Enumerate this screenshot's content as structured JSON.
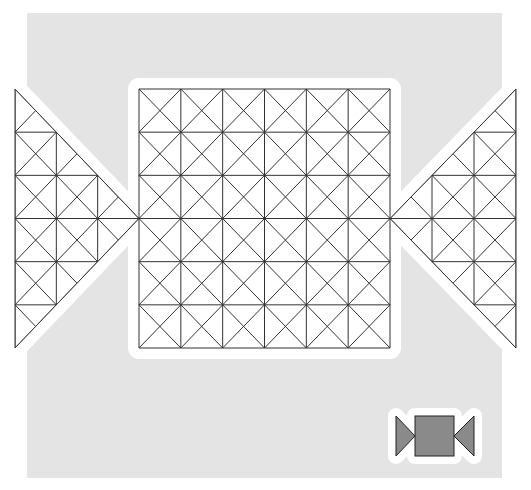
{
  "colors": {
    "page_bg": "#ffffff",
    "board_bg": "#e4e4e4",
    "piece_bg": "#ffffff",
    "halo": "#ffffff",
    "line": "#333333",
    "thumb_fill": "#8a8a8a",
    "thumb_stroke": "#222222"
  },
  "board": {
    "region": {
      "x": 27,
      "y": 13,
      "w": 475,
      "h": 465
    },
    "center_square": {
      "x": 139,
      "y": 89,
      "w": 251,
      "h": 259,
      "cols": 6,
      "rows": 6
    },
    "left_triangle": {
      "points": [
        [
          15,
          89
        ],
        [
          15,
          348
        ],
        [
          139,
          218.5
        ]
      ],
      "cols": 3,
      "rows": 6
    },
    "right_triangle": {
      "points": [
        [
          516,
          89
        ],
        [
          516,
          348
        ],
        [
          390,
          218.5
        ]
      ],
      "cols": 3,
      "rows": 6
    }
  },
  "thumbnail": {
    "label": "shape-preview",
    "left_triangle": [
      [
        10,
        16
      ],
      [
        10,
        56
      ],
      [
        29,
        36
      ]
    ],
    "square": {
      "x": 29,
      "y": 16,
      "w": 39,
      "h": 40
    },
    "right_triangle": [
      [
        88,
        16
      ],
      [
        88,
        56
      ],
      [
        68,
        36
      ]
    ]
  }
}
